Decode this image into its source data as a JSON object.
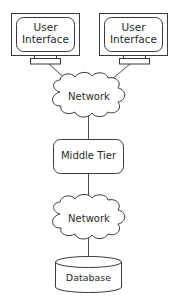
{
  "diagram": {
    "type": "architecture",
    "nodes": {
      "ui_left": {
        "label_line1": "User",
        "label_line2": "Interface",
        "shape": "monitor"
      },
      "ui_right": {
        "label_line1": "User",
        "label_line2": "Interface",
        "shape": "monitor"
      },
      "network_top": {
        "label": "Network",
        "shape": "cloud"
      },
      "middle_tier": {
        "label": "Middle Tier",
        "shape": "rounded-rectangle"
      },
      "network_bottom": {
        "label": "Network",
        "shape": "cloud"
      },
      "database": {
        "label": "Database",
        "shape": "cylinder"
      }
    },
    "edges": [
      {
        "from": "ui_left",
        "to": "network_top"
      },
      {
        "from": "ui_right",
        "to": "network_top"
      },
      {
        "from": "network_top",
        "to": "middle_tier"
      },
      {
        "from": "middle_tier",
        "to": "network_bottom"
      },
      {
        "from": "network_bottom",
        "to": "database"
      }
    ],
    "colors": {
      "stroke": "#3a3a3a",
      "fill": "#ffffff",
      "text": "#2a2a2a",
      "background": "#ffffff"
    }
  }
}
